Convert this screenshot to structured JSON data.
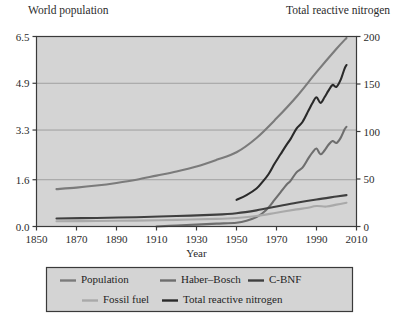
{
  "headers": {
    "left": "World population",
    "right": "Total reactive nitrogen"
  },
  "colors": {
    "plot_background": "#d4d4d4",
    "legend_background": "#d4d4d4",
    "frame": "#3a3a3a",
    "gridline": "#9a9a9a",
    "text": "#2b2b2b",
    "population": "#7b7b7b",
    "haber_bosch": "#6e6e6e",
    "c_bnf": "#3f3f3f",
    "fossil_fuel": "#a9a9a9",
    "total_reactive_nitrogen": "#2a2a2a"
  },
  "chart_data": {
    "type": "line",
    "title": "",
    "xlabel": "Year",
    "ylabel": "World population",
    "y2label": "Total reactive nitrogen",
    "grid": true,
    "legend_position": "bottom",
    "xlim": [
      1850,
      2010
    ],
    "xticks": [
      1850,
      1870,
      1890,
      1910,
      1930,
      1950,
      1970,
      1990,
      2010
    ],
    "xticklabels": [
      "1850",
      "1870",
      "1890",
      "1910",
      "1930",
      "1950",
      "1970",
      "1990",
      "2010"
    ],
    "ylim": [
      0.0,
      6.5
    ],
    "yticks": [
      0.0,
      1.6,
      3.3,
      4.9,
      6.5
    ],
    "yticklabels": [
      "0.0",
      "1.6",
      "3.3",
      "4.9",
      "6.5"
    ],
    "y2lim": [
      0,
      200
    ],
    "y2ticks": [
      0,
      50,
      100,
      150,
      200
    ],
    "y2ticklabels": [
      "0",
      "50",
      "100",
      "150",
      "200"
    ],
    "series": [
      {
        "name": "Population",
        "axis": "left",
        "color": "#7b7b7b",
        "width": 2.1,
        "x": [
          1860,
          1870,
          1880,
          1890,
          1900,
          1910,
          1920,
          1930,
          1940,
          1950,
          1960,
          1970,
          1980,
          1990,
          2000,
          2005
        ],
        "values": [
          1.28,
          1.33,
          1.4,
          1.49,
          1.6,
          1.74,
          1.88,
          2.05,
          2.28,
          2.54,
          3.03,
          3.7,
          4.44,
          5.28,
          6.08,
          6.45
        ]
      },
      {
        "name": "Haber–Bosch",
        "axis": "right",
        "color": "#6e6e6e",
        "width": 2.1,
        "x": [
          1910,
          1920,
          1930,
          1940,
          1950,
          1955,
          1960,
          1963,
          1966,
          1969,
          1972,
          1975,
          1977,
          1980,
          1983,
          1986,
          1988,
          1990,
          1992,
          1994,
          1996,
          1998,
          2000,
          2002,
          2004,
          2005
        ],
        "values": [
          0,
          1,
          2,
          3,
          4,
          6,
          10,
          14,
          20,
          28,
          36,
          44,
          48,
          57,
          62,
          72,
          78,
          82,
          76,
          80,
          86,
          90,
          88,
          93,
          102,
          105
        ]
      },
      {
        "name": "C-BNF",
        "axis": "right",
        "color": "#3f3f3f",
        "width": 2.1,
        "x": [
          1860,
          1880,
          1900,
          1920,
          1940,
          1950,
          1960,
          1970,
          1980,
          1990,
          2000,
          2005
        ],
        "values": [
          8.5,
          9.0,
          9.8,
          11.0,
          12.5,
          14.0,
          17.0,
          21.0,
          25.0,
          28.5,
          31.5,
          33.0
        ]
      },
      {
        "name": "Fossil fuel",
        "axis": "right",
        "color": "#a9a9a9",
        "width": 2.1,
        "x": [
          1860,
          1880,
          1900,
          1920,
          1940,
          1950,
          1960,
          1970,
          1980,
          1985,
          1990,
          1995,
          2000,
          2005
        ],
        "values": [
          5.5,
          5.8,
          6.2,
          7.0,
          8.0,
          9.0,
          11.0,
          14.5,
          18.0,
          19.5,
          21.5,
          21.0,
          23.0,
          25.0
        ]
      },
      {
        "name": "Total reactive nitrogen",
        "axis": "right",
        "color": "#2a2a2a",
        "width": 2.1,
        "x": [
          1950,
          1955,
          1960,
          1963,
          1966,
          1969,
          1972,
          1975,
          1977,
          1980,
          1983,
          1986,
          1988,
          1990,
          1992,
          1994,
          1996,
          1998,
          2000,
          2002,
          2004,
          2005
        ],
        "values": [
          28,
          33,
          40,
          47,
          55,
          66,
          76,
          86,
          92,
          103,
          110,
          122,
          130,
          136,
          130,
          136,
          143,
          149,
          147,
          154,
          166,
          170
        ]
      }
    ],
    "legend_entries": [
      {
        "label": "Population",
        "color": "#7b7b7b"
      },
      {
        "label": "Haber–Bosch",
        "color": "#6e6e6e"
      },
      {
        "label": "C-BNF",
        "color": "#3f3f3f"
      },
      {
        "label": "Fossil fuel",
        "color": "#a9a9a9"
      },
      {
        "label": "Total reactive nitrogen",
        "color": "#2a2a2a"
      }
    ]
  }
}
